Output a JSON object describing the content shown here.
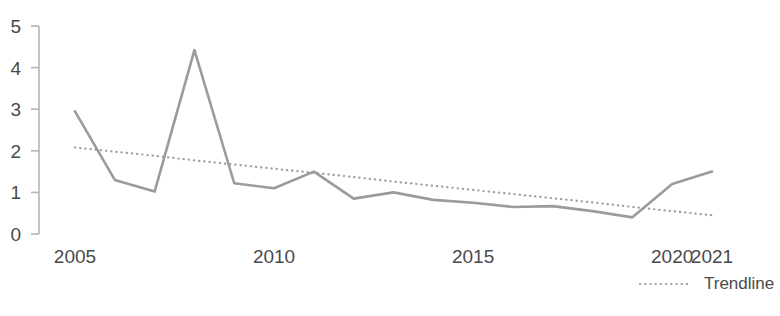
{
  "chart_data": {
    "type": "line",
    "title": "",
    "subtitle": "",
    "xlabel": "",
    "ylabel": "",
    "xlim": [
      2005,
      2021
    ],
    "ylim": [
      0,
      5
    ],
    "grid": false,
    "legend_position": "bottom-right",
    "x": [
      2005,
      2006,
      2007,
      2008,
      2009,
      2010,
      2011,
      2012,
      2013,
      2014,
      2015,
      2016,
      2017,
      2018,
      2019,
      2020,
      2021
    ],
    "y_ticks": [
      "0",
      "1",
      "2",
      "3",
      "4",
      "5"
    ],
    "y_tick_values": [
      0,
      1,
      2,
      3,
      4,
      5
    ],
    "x_ticks": [
      "2005",
      "2010",
      "2015",
      "2020",
      "2021"
    ],
    "x_tick_values": [
      2005,
      2010,
      2015,
      2020,
      2021
    ],
    "series": [
      {
        "name": "Value",
        "style": "solid",
        "color": "#9b9b9b",
        "values": [
          2.95,
          1.3,
          1.02,
          4.42,
          1.22,
          1.1,
          1.5,
          0.85,
          1.0,
          0.82,
          0.75,
          0.65,
          0.67,
          0.55,
          0.4,
          1.2,
          1.5
        ]
      },
      {
        "name": "Trendline",
        "style": "dotted",
        "color": "#9b9b9b",
        "values": [
          2.08,
          1.98,
          1.88,
          1.77,
          1.67,
          1.57,
          1.47,
          1.37,
          1.26,
          1.16,
          1.06,
          0.96,
          0.86,
          0.76,
          0.65,
          0.55,
          0.45
        ]
      }
    ],
    "annotations": []
  },
  "legend": {
    "items": [
      {
        "label": "Trendline",
        "style": "dotted",
        "color": "#9b9b9b"
      }
    ]
  },
  "axis_colors": {
    "axis_line": "#b4b4b4",
    "tick_label": "#4a4a4a",
    "series_line": "#9b9b9b"
  }
}
